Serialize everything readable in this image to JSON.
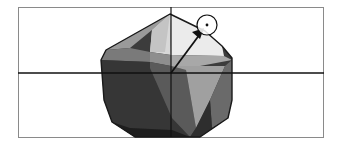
{
  "figure": {
    "frame": {
      "x": 18,
      "y": 7,
      "width": 306,
      "height": 131,
      "stroke": "#8a8a8a"
    },
    "axes": {
      "origin": {
        "x": 171,
        "y": 73
      },
      "horizontal": {
        "x1": 18,
        "x2": 324,
        "y": 73,
        "color": "#111111"
      },
      "vertical": {
        "x": 171,
        "y1": 7,
        "y2": 137,
        "color": "#111111"
      }
    },
    "vector": {
      "from": {
        "x": 171,
        "y": 73
      },
      "to": {
        "x": 204,
        "y": 29
      },
      "color": "#111111"
    },
    "target_marker": {
      "cx": 207,
      "cy": 25,
      "r": 10,
      "dot_r": 1.4
    },
    "colors": {
      "light": "#e6e6e6",
      "light_mid": "#c9c9c9",
      "mid": "#a4a4a4",
      "mid_dark": "#7c7c7c",
      "dark": "#4a4a4a",
      "darkest": "#222222",
      "outline": "#1a1a1a"
    }
  }
}
